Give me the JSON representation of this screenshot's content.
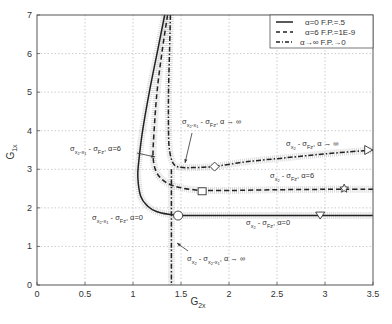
{
  "chart_data": {
    "type": "line",
    "title": "",
    "xlabel": "G2x",
    "xlabel_main": "G",
    "xlabel_sub": "2x",
    "ylabel": "G1x",
    "ylabel_main": "G",
    "ylabel_sub": "1x",
    "xlim": [
      0,
      3.5
    ],
    "ylim": [
      0,
      7
    ],
    "xticks": [
      "0",
      "0.5",
      "1",
      "1.5",
      "2",
      "2.5",
      "3",
      "3.5"
    ],
    "yticks": [
      "0",
      "1",
      "2",
      "3",
      "4",
      "5",
      "6",
      "7"
    ],
    "grid": true,
    "legend_position": "upper right",
    "legend": [
      {
        "label": "α=0  F.P.=.5",
        "style": "solid"
      },
      {
        "label": "α=6  F.P.=1E-9",
        "style": "dashed"
      },
      {
        "label": "α→∞  F.P.→0",
        "style": "dashdot"
      }
    ],
    "series": [
      {
        "name": "σx2-x1 = σFz, α=0 (vertical branch)",
        "style": "solid",
        "points": [
          [
            1.33,
            7.0
          ],
          [
            1.25,
            6.0
          ],
          [
            1.17,
            5.0
          ],
          [
            1.1,
            4.0
          ],
          [
            1.06,
            3.2
          ],
          [
            1.05,
            2.8
          ],
          [
            1.08,
            2.3
          ],
          [
            1.15,
            2.05
          ],
          [
            1.25,
            1.9
          ],
          [
            1.4,
            1.82
          ]
        ]
      },
      {
        "name": "σx2 = σFz, α=0 (horizontal branch)",
        "style": "solid",
        "points": [
          [
            1.4,
            1.82
          ],
          [
            1.6,
            1.8
          ],
          [
            2.0,
            1.8
          ],
          [
            2.5,
            1.8
          ],
          [
            3.0,
            1.8
          ],
          [
            3.5,
            1.8
          ]
        ],
        "markers": [
          {
            "shape": "circle",
            "x": 1.47,
            "y": 1.8
          },
          {
            "shape": "triangle-down",
            "x": 2.95,
            "y": 1.8
          }
        ]
      },
      {
        "name": "σx2-x1 = σFz, α=6 (vertical branch)",
        "style": "dashed",
        "points": [
          [
            1.36,
            7.0
          ],
          [
            1.3,
            6.0
          ],
          [
            1.25,
            5.0
          ],
          [
            1.22,
            4.0
          ],
          [
            1.21,
            3.3
          ],
          [
            1.25,
            2.9
          ],
          [
            1.35,
            2.65
          ],
          [
            1.5,
            2.52
          ],
          [
            1.7,
            2.45
          ]
        ]
      },
      {
        "name": "σx2 = σFz, α=6 (horizontal branch)",
        "style": "dashed",
        "points": [
          [
            1.7,
            2.45
          ],
          [
            2.0,
            2.45
          ],
          [
            2.5,
            2.47
          ],
          [
            3.0,
            2.48
          ],
          [
            3.5,
            2.48
          ]
        ],
        "markers": [
          {
            "shape": "square",
            "x": 1.72,
            "y": 2.43
          },
          {
            "shape": "star",
            "x": 3.2,
            "y": 2.5
          }
        ]
      },
      {
        "name": "σx2-x1 = σFz, α→∞ (vertical branch)",
        "style": "dashdot",
        "points": [
          [
            1.39,
            7.0
          ],
          [
            1.38,
            6.0
          ],
          [
            1.37,
            5.0
          ],
          [
            1.37,
            4.0
          ],
          [
            1.38,
            3.5
          ],
          [
            1.42,
            3.15
          ],
          [
            1.5,
            3.05
          ],
          [
            1.7,
            3.05
          ],
          [
            1.85,
            3.07
          ]
        ]
      },
      {
        "name": "σx2 = σFz, α→∞ (rising branch)",
        "style": "dashdot",
        "points": [
          [
            1.85,
            3.07
          ],
          [
            2.2,
            3.2
          ],
          [
            2.6,
            3.3
          ],
          [
            3.0,
            3.4
          ],
          [
            3.5,
            3.5
          ]
        ],
        "markers": [
          {
            "shape": "diamond",
            "x": 1.85,
            "y": 3.07
          },
          {
            "shape": "triangle-right",
            "x": 3.45,
            "y": 3.5
          }
        ]
      },
      {
        "name": "σx2 = σx2-x1, α→∞",
        "style": "dashdot",
        "points": [
          [
            1.4,
            3.0
          ],
          [
            1.4,
            2.0
          ],
          [
            1.4,
            1.0
          ],
          [
            1.4,
            0.0
          ]
        ]
      }
    ],
    "annotations": [
      {
        "text": "σx2-x1 = σFz , α=6",
        "x": 0.35,
        "y": 3.5
      },
      {
        "text": "σx2-x1 = σFz , α→∞",
        "x": 1.52,
        "y": 4.15
      },
      {
        "text": "σx2-x1 = σFz , α=0",
        "x": 0.55,
        "y": 1.85
      },
      {
        "text": "σx2 = σFz , α→∞",
        "x": 2.6,
        "y": 3.75
      },
      {
        "text": "σx2 = σFz , α=6",
        "x": 2.45,
        "y": 2.75
      },
      {
        "text": "σx2 = σFz , α=0",
        "x": 2.15,
        "y": 1.55
      },
      {
        "text": "σx2 = σx2-x1 , α→∞",
        "x": 1.55,
        "y": 0.65
      }
    ]
  },
  "labels": {
    "sigma": "σ",
    "sub_x2": "x",
    "sub_x2_2": "2",
    "sub_x2x1": "x",
    "minus_x1": "-x",
    "sub_1": "1",
    "sub_Fz": "Fz",
    "eq": " - ",
    "alpha0": ", α=0",
    "alpha6": ", α=6",
    "alphainf": ", α → ∞"
  }
}
